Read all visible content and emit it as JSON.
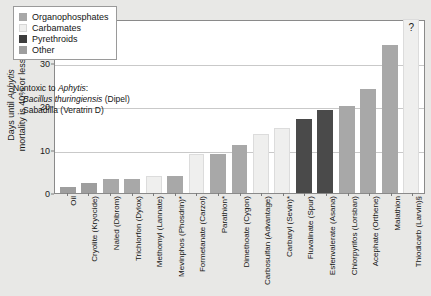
{
  "chart_data": {
    "type": "bar",
    "title": "",
    "xlabel": "",
    "ylabel_line1": "Days until Aphytis",
    "ylabel_line2": "mortality is 40% or less",
    "ylim": [
      0,
      40
    ],
    "yticks": [
      0,
      10,
      20,
      30,
      40
    ],
    "grid": true,
    "legend_position": "top-left",
    "categories": [
      "Oil",
      "Cryolite (Kryocide)",
      "Naled (Dibrom)",
      "Trichlorfon (Dylox)",
      "Methomyl (Lannate)",
      "Mevinphos (Phosdrin)*",
      "Formetanate (Carzol)",
      "Parathion*",
      "Dimethoate (Cygon)",
      "Carbosulfan (Advantage)",
      "Carbaryl (Sevin)*",
      "Fluvalinate (Spur)",
      "Esfenvalerate (Asana)",
      "Chlorpyrifos (Lorsban)",
      "Acephate (Orthene)",
      "Malathion",
      "Thiodicarb (Larvin)§"
    ],
    "values": [
      1.4,
      2.3,
      3.2,
      3.2,
      4.0,
      4.0,
      9.0,
      9.0,
      11.0,
      13.5,
      15.0,
      17.0,
      19.0,
      20.0,
      24.0,
      34.0,
      40.0
    ],
    "group_of_bar": [
      "other",
      "other",
      "organophosphates",
      "organophosphates",
      "carbamates",
      "organophosphates",
      "carbamates",
      "organophosphates",
      "organophosphates",
      "carbamates",
      "carbamates",
      "pyrethroids",
      "pyrethroids",
      "organophosphates",
      "organophosphates",
      "organophosphates",
      "carbamates"
    ],
    "annotations": [
      {
        "text": "?",
        "at_category": "Thiodicarb (Larvin)§",
        "meaning": "value uncertain / exceeds axis"
      }
    ]
  },
  "legend": {
    "items": [
      {
        "key": "organophosphates",
        "label": "Organophosphates",
        "color": "#a8a8a8"
      },
      {
        "key": "carbamates",
        "label": "Carbamates",
        "color": "#efefee"
      },
      {
        "key": "pyrethroids",
        "label": "Pyrethroids",
        "color": "#3d3d3d"
      },
      {
        "key": "other",
        "label": "Other",
        "color": "#9e9e9e"
      }
    ]
  },
  "annotation_box": {
    "heading": "Nontoxic to Aphytis:",
    "heading_plain": "Nontoxic to ",
    "heading_italic": "Aphytis",
    "heading_colon": ":",
    "lines": [
      {
        "italic": "Bacillus thuringiensis",
        "plain": " (Dipel)"
      },
      {
        "italic": "",
        "plain": "Sabadilla (Veratrin D)"
      }
    ]
  },
  "axis": {
    "y_ticks_text": [
      "0",
      "10",
      "20",
      "30",
      "40"
    ],
    "y_label_part1": "Days until ",
    "y_label_italic": "Aphytis",
    "y_label_part2": "mortality is 40% or less"
  },
  "marks": {
    "question_mark": "?"
  },
  "colors": {
    "background": "#e8e8e6",
    "plot_background": "#ffffff",
    "gridline": "#c9c9c9",
    "axis": "#8a8a8a",
    "text": "#141414"
  }
}
